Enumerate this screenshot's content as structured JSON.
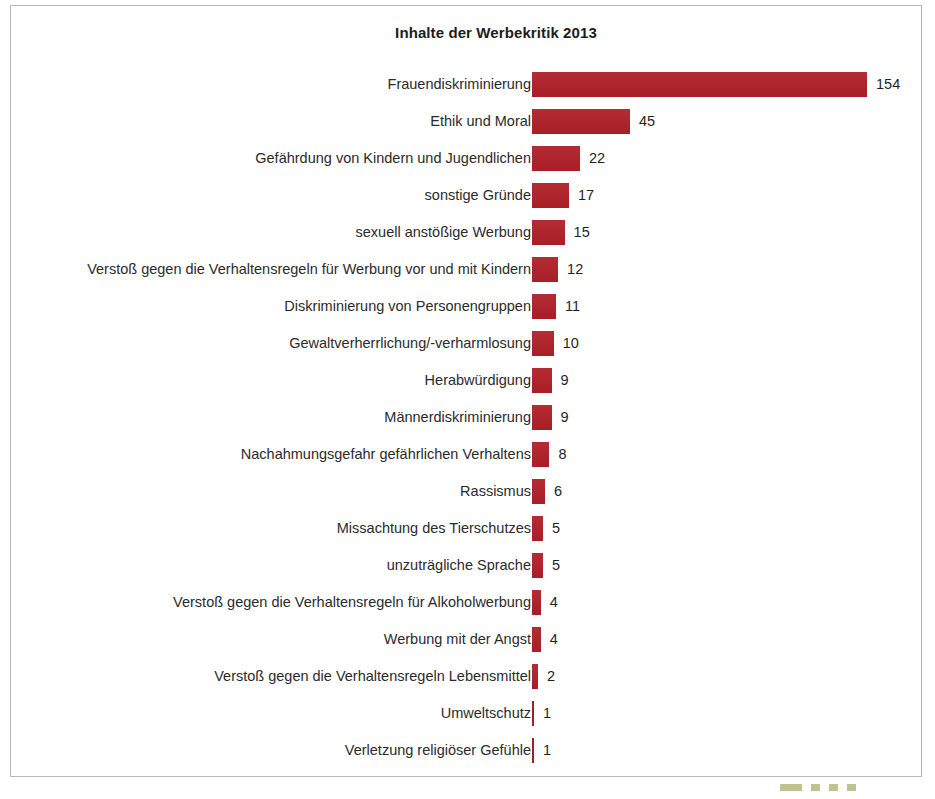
{
  "chart_data": {
    "type": "bar",
    "orientation": "horizontal",
    "title": "Inhalte der Werbekritik 2013",
    "xlabel": "",
    "ylabel": "",
    "grid": false,
    "legend": null,
    "xlim": [
      0,
      154
    ],
    "categories": [
      "Frauendiskriminierung",
      "Ethik und Moral",
      "Gefährdung von Kindern und Jugendlichen",
      "sonstige Gründe",
      "sexuell anstößige Werbung",
      "Verstoß gegen die Verhaltensregeln für Werbung vor und mit Kindern",
      "Diskriminierung von Personengruppen",
      "Gewaltverherrlichung/-verharmlosung",
      "Herabwürdigung",
      "Männerdiskriminierung",
      "Nachahmungsgefahr gefährlichen Verhaltens",
      "Rassismus",
      "Missachtung des Tierschutzes",
      "unzuträgliche Sprache",
      "Verstoß gegen die Verhaltensregeln für Alkoholwerbung",
      "Werbung mit der Angst",
      "Verstoß gegen die Verhaltensregeln Lebensmittel",
      "Umweltschutz",
      "Verletzung religiöser Gefühle"
    ],
    "values": [
      154,
      45,
      22,
      17,
      15,
      12,
      11,
      10,
      9,
      9,
      8,
      6,
      5,
      5,
      4,
      4,
      2,
      1,
      1
    ],
    "value_labels": [
      "154",
      "45",
      "22",
      "17",
      "15",
      "12",
      "11",
      "10",
      "9",
      "9",
      "8",
      "6",
      "5",
      "5",
      "4",
      "4",
      "2",
      "1",
      "1"
    ],
    "bar_color": "#b02029",
    "text_color": "#2b2b2b",
    "background_color": "#ffffff",
    "border_color": "#b9b9b9"
  }
}
